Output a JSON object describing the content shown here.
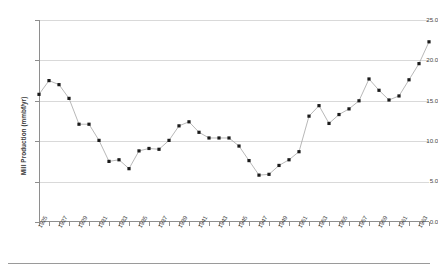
{
  "chart_data": {
    "type": "line",
    "title": "",
    "xlabel": "",
    "ylabel": "Mill Production (mmbf/yr)",
    "ylim": [
      0.0,
      25.0
    ],
    "yticks": [
      "0.0",
      "5.0",
      "10.0",
      "15.0",
      "20.0",
      "25.0"
    ],
    "ytick_values": [
      0.0,
      5.0,
      10.0,
      15.0,
      20.0,
      25.0
    ],
    "grid": true,
    "legend": "none",
    "marker": "filled-square",
    "line_color": "#a6a6a6",
    "marker_color": "#1b1b1b",
    "xtick_labels": [
      "1925",
      "1927",
      "1929",
      "1931",
      "1933",
      "1935",
      "1937",
      "1939",
      "1941",
      "1943",
      "1945",
      "1947",
      "1949",
      "1951",
      "1953",
      "1955",
      "1957",
      "1959",
      "1961",
      "1963"
    ],
    "x": [
      1925,
      1926,
      1927,
      1928,
      1929,
      1930,
      1931,
      1932,
      1933,
      1934,
      1935,
      1936,
      1937,
      1938,
      1939,
      1940,
      1941,
      1942,
      1943,
      1944,
      1945,
      1946,
      1947,
      1948,
      1949,
      1950,
      1951,
      1952,
      1953,
      1954,
      1955,
      1956,
      1957,
      1958,
      1959,
      1960,
      1961,
      1962,
      1963,
      1964
    ],
    "values": [
      15.8,
      17.5,
      17.0,
      15.3,
      12.1,
      12.1,
      10.1,
      7.5,
      7.7,
      6.6,
      8.8,
      9.1,
      9.0,
      10.1,
      11.9,
      12.4,
      11.1,
      10.4,
      10.4,
      10.4,
      9.4,
      7.6,
      5.8,
      5.9,
      7.0,
      7.7,
      8.7,
      13.1,
      14.4,
      12.2,
      13.3,
      14.0,
      15.0,
      17.7,
      16.3,
      15.1,
      15.6,
      17.6,
      19.6,
      22.3
    ]
  },
  "axis": {
    "y_title": "Mill Production (mmbf/yr)"
  }
}
